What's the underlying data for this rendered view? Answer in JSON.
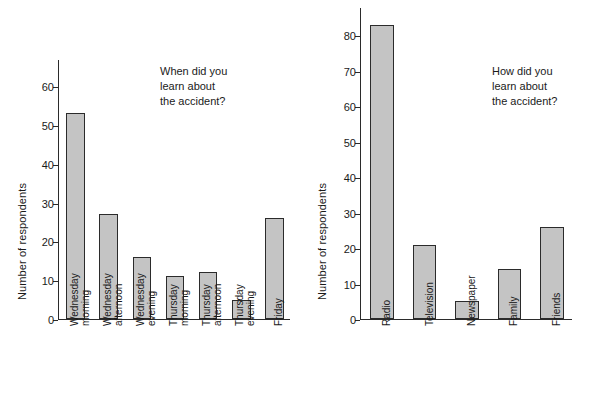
{
  "figure": {
    "background": "#ffffff",
    "bar_fill": "#c4c4c4",
    "bar_stroke": "#2b2b2b",
    "axis_color": "#2b2b2b"
  },
  "chart_data": [
    {
      "type": "bar",
      "title": "",
      "annotation": "When did you\nlearn about\nthe accident?",
      "annotation_lines": [
        "When did you",
        "learn about",
        "the accident?"
      ],
      "xlabel": "",
      "ylabel": "Number of respondents",
      "categories": [
        "Wednesday morning",
        "Wednesday afternoon",
        "Wednesday evening",
        "Thursday morning",
        "Thursday afternoon",
        "Thursday evening",
        "Friday"
      ],
      "category_lines": [
        [
          "Wednesday",
          "morning"
        ],
        [
          "Wednesday",
          "afternoon"
        ],
        [
          "Wednesday",
          "evening"
        ],
        [
          "Thursday",
          "morning"
        ],
        [
          "Thursday",
          "afternoon"
        ],
        [
          "Thursday",
          "evening"
        ],
        [
          "Friday",
          ""
        ]
      ],
      "values": [
        53,
        27,
        16,
        11,
        12,
        5,
        26
      ],
      "ylim": [
        0,
        67
      ],
      "yticks": [
        0,
        10,
        20,
        30,
        40,
        50,
        60
      ],
      "ytick_labels": [
        "0",
        "10",
        "20",
        "30",
        "40",
        "50",
        "60"
      ],
      "grid": false,
      "legend": "none"
    },
    {
      "type": "bar",
      "title": "",
      "annotation": "How did you\nlearn about\nthe accident?",
      "annotation_lines": [
        "How did you",
        "learn about",
        "the accident?"
      ],
      "xlabel": "",
      "ylabel": "Number of respondents",
      "categories": [
        "Radio",
        "Television",
        "Newspaper",
        "Family",
        "Friends"
      ],
      "category_lines": [
        [
          "Radio",
          ""
        ],
        [
          "Television",
          ""
        ],
        [
          "Newspaper",
          ""
        ],
        [
          "Family",
          ""
        ],
        [
          "Friends",
          ""
        ]
      ],
      "values": [
        83,
        21,
        5,
        14,
        26
      ],
      "ylim": [
        0,
        88
      ],
      "yticks": [
        0,
        10,
        20,
        30,
        40,
        50,
        60,
        70,
        80
      ],
      "ytick_labels": [
        "0",
        "10",
        "20",
        "30",
        "40",
        "50",
        "60",
        "70",
        "80"
      ],
      "grid": false,
      "legend": "none"
    }
  ]
}
